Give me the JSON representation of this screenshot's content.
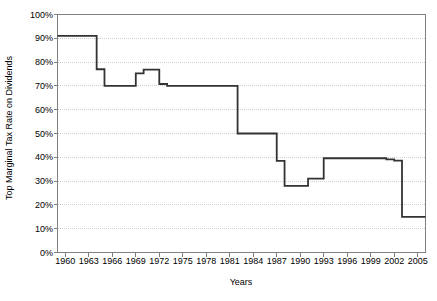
{
  "chart_data": {
    "type": "line",
    "title": "",
    "xlabel": "Years",
    "ylabel": "Top Marginal Tax Rate on Dividends",
    "xlim": [
      1959,
      2006
    ],
    "ylim": [
      0,
      100
    ],
    "grid": true,
    "legend": "none",
    "x_tick_labels": [
      "1960",
      "1963",
      "1966",
      "1969",
      "1972",
      "1975",
      "1978",
      "1981",
      "1984",
      "1987",
      "1990",
      "1993",
      "1996",
      "1999",
      "2002",
      "2005"
    ],
    "x_tick_values": [
      1960,
      1963,
      1966,
      1969,
      1972,
      1975,
      1978,
      1981,
      1984,
      1987,
      1990,
      1993,
      1996,
      1999,
      2002,
      2005
    ],
    "y_tick_labels": [
      "0%",
      "10%",
      "20%",
      "30%",
      "40%",
      "50%",
      "60%",
      "70%",
      "80%",
      "90%",
      "100%"
    ],
    "y_tick_values": [
      0,
      10,
      20,
      30,
      40,
      50,
      60,
      70,
      80,
      90,
      100
    ],
    "series": [
      {
        "name": "Top Marginal Tax Rate on Dividends",
        "color": "#333333",
        "step": "post",
        "x": [
          1959,
          1960,
          1961,
          1962,
          1963,
          1964,
          1965,
          1966,
          1967,
          1968,
          1969,
          1970,
          1971,
          1972,
          1973,
          1974,
          1975,
          1976,
          1977,
          1978,
          1979,
          1980,
          1981,
          1982,
          1983,
          1984,
          1985,
          1986,
          1987,
          1988,
          1989,
          1990,
          1991,
          1992,
          1993,
          1994,
          1995,
          1996,
          1997,
          1998,
          1999,
          2000,
          2001,
          2002,
          2003,
          2004,
          2005,
          2006
        ],
        "values": [
          91,
          91,
          91,
          91,
          91,
          77,
          70,
          70,
          70,
          70,
          75.3,
          76.8,
          76.8,
          70.8,
          70,
          70,
          70,
          70,
          70,
          70,
          70,
          70,
          70,
          50,
          50,
          50,
          50,
          50,
          38.5,
          28,
          28,
          28,
          31,
          31,
          39.6,
          39.6,
          39.6,
          39.6,
          39.6,
          39.6,
          39.6,
          39.6,
          39.1,
          38.6,
          15,
          15,
          15,
          15
        ]
      }
    ]
  },
  "axis": {
    "y_title": "Top Marginal Tax Rate on Dividends",
    "x_title": "Years"
  },
  "style": {
    "line_color": "#333333",
    "grid_color": "#d0d0d0",
    "frame_color": "#808080",
    "background": "#ffffff"
  }
}
